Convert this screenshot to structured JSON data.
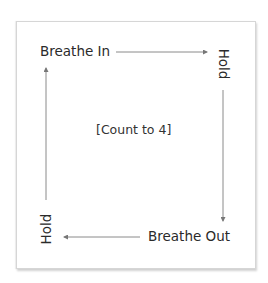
{
  "diagram": {
    "type": "box-breathing",
    "steps": [
      {
        "label": "Breathe In",
        "position": "top-left"
      },
      {
        "label": "Hold",
        "position": "top-right",
        "orientation": "vertical-down"
      },
      {
        "label": "Breathe Out",
        "position": "bottom-right"
      },
      {
        "label": "Hold",
        "position": "bottom-left",
        "orientation": "vertical-up"
      }
    ],
    "center_text": "[Count to 4]",
    "colors": {
      "line": "#8a8a8a",
      "text": "#2a2a2a",
      "border": "#d6d6d6"
    }
  }
}
